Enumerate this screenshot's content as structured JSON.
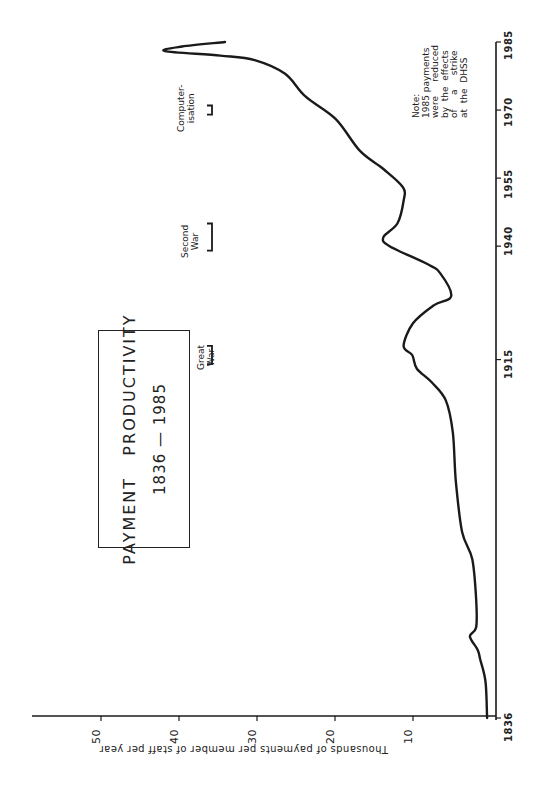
{
  "chart_data": {
    "type": "line",
    "title": "PAYMENT PRODUCTIVITY",
    "subtitle": "1836 — 1985",
    "xlabel": "",
    "ylabel": "Thousands of payments per member of staff per year",
    "orientation": "rotated 90° counter-clockwise (years run along right edge bottom-to-top; values run along bottom edge right-to-left)",
    "xlim": [
      1836,
      1985
    ],
    "ylim": [
      0,
      55
    ],
    "x_ticks": [
      1836,
      1915,
      1940,
      1955,
      1970,
      1985
    ],
    "y_ticks": [
      10,
      20,
      30,
      40,
      50
    ],
    "grid": false,
    "legend": null,
    "series": [
      {
        "name": "Payment productivity",
        "x": [
          1836,
          1844,
          1849,
          1851,
          1854,
          1856,
          1862,
          1871,
          1877,
          1888,
          1899,
          1906,
          1910,
          1913,
          1916,
          1918,
          1923,
          1927,
          1929,
          1934,
          1936,
          1940,
          1942,
          1945,
          1950,
          1953,
          1957,
          1961,
          1968,
          1973,
          1978,
          1981,
          1982,
          1983,
          1984,
          1985
        ],
        "values": [
          0.5,
          0.7,
          1.4,
          1.7,
          2.7,
          1.9,
          1.9,
          2.4,
          3.7,
          4.5,
          4.9,
          5.8,
          7.6,
          9.5,
          10.1,
          11.2,
          10.0,
          7.3,
          5.1,
          6.5,
          8.1,
          13.0,
          13.8,
          12.0,
          11.2,
          11.3,
          13.8,
          16.8,
          19.9,
          23.8,
          26.4,
          30.3,
          34.7,
          41.8,
          39.6,
          34.1
        ]
      }
    ],
    "annotations": [
      {
        "label": "Great War",
        "lines": [
          "Great",
          "War"
        ],
        "x_range": [
          1914,
          1918
        ]
      },
      {
        "label": "Second War",
        "lines": [
          "Second",
          "War"
        ],
        "x_range": [
          1939,
          1945
        ]
      },
      {
        "label": "Computerisation",
        "lines": [
          "Computer-",
          "isation"
        ],
        "x_range": [
          1969,
          1971
        ]
      }
    ],
    "note": {
      "lines": [
        "Note:",
        "1985 payments",
        "were reduced",
        "by the effects",
        "of a strike",
        "at the DHSS"
      ]
    }
  },
  "labels": {
    "title_line1": "PAYMENT   PRODUCTIVITY",
    "title_line2": "1836 — 1985",
    "ylabel": "Thousands of payments per member of staff per year",
    "y_tick_10": "10",
    "y_tick_20": "20",
    "y_tick_30": "30",
    "y_tick_40": "40",
    "y_tick_50": "50",
    "x_tick_1836": "1836",
    "x_tick_1915": "1915",
    "x_tick_1940": "1940",
    "x_tick_1955": "1955",
    "x_tick_1970": "1970",
    "x_tick_1985": "1985",
    "event_great_1": "Great",
    "event_great_2": "War",
    "event_second_1": "Second",
    "event_second_2": "War",
    "event_comp_1": "Computer-",
    "event_comp_2": "isation",
    "note_1": "Note:",
    "note_2": "1985 payments",
    "note_3": "were     reduced",
    "note_4": "by  the  effects",
    "note_5": "of     a     strike",
    "note_6": "at  the  DHSS"
  },
  "colors": {
    "ink": "#1a1a1a",
    "background": "#ffffff"
  }
}
